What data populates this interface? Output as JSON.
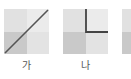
{
  "panels": [
    {
      "label": "가",
      "line": "diagonal",
      "colors": {
        "top_left": "#e1e1e1",
        "top_right": "#ebebeb",
        "bottom_left": "#c9c9c9",
        "bottom_right": "#e3e3e3",
        "line": "#555555"
      }
    },
    {
      "label": "나",
      "line": "L-shape (vertical from top center to middle, then horizontal to right edge)",
      "colors": {
        "top_left": "#e1e1e1",
        "top_right": "#ebebeb",
        "bottom_left": "#c9c9c9",
        "bottom_right": "#e3e3e3",
        "line": "#444444"
      }
    },
    {
      "label": "",
      "line": "partially visible (cropped)",
      "colors": {
        "top_left": "#e1e1e1",
        "bottom_left": "#c9c9c9"
      }
    }
  ]
}
